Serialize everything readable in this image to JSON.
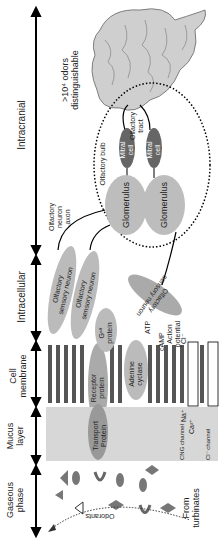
{
  "layers": [
    {
      "id": "intracranial",
      "label": "Intracranial"
    },
    {
      "id": "intracellular",
      "label": "Intracellular"
    },
    {
      "id": "cell_membrane",
      "label": "Cell\nmembrane"
    },
    {
      "id": "mucus",
      "label": "Mucus\nlayer"
    },
    {
      "id": "gaseous",
      "label": "Gaseous\nphase"
    }
  ],
  "brain": {
    "note_line1": ">10⁴ odors",
    "note_line2": "distinguishable"
  },
  "olfactory_tract": "Olfactory\ntract",
  "mitral_cell": "Mitral\ncell",
  "olfactory_bulb": "Olfactory bulb",
  "glomerulus": "Glomerulus",
  "axon": "Olfactory\nneuron\naxon",
  "osn": "Olfactory\nsensory neuron",
  "membrane": {
    "receptor": "Receptor\nprotein",
    "gprotein": "Gᵒˡᶠ\nprotein",
    "adenine": "Adenine\ncyclase",
    "atp": "ATP",
    "camp": "cAMP",
    "action": "Action\npotential",
    "cl": "Cl⁻",
    "na": "Na⁺",
    "ca": "Ca²⁺",
    "cng": "CNG channel",
    "clchannel": "Cl⁻ channel",
    "transport": "Transport\nProtein"
  },
  "odorants": "Odorants",
  "turbinates": "From\nturbinates"
}
